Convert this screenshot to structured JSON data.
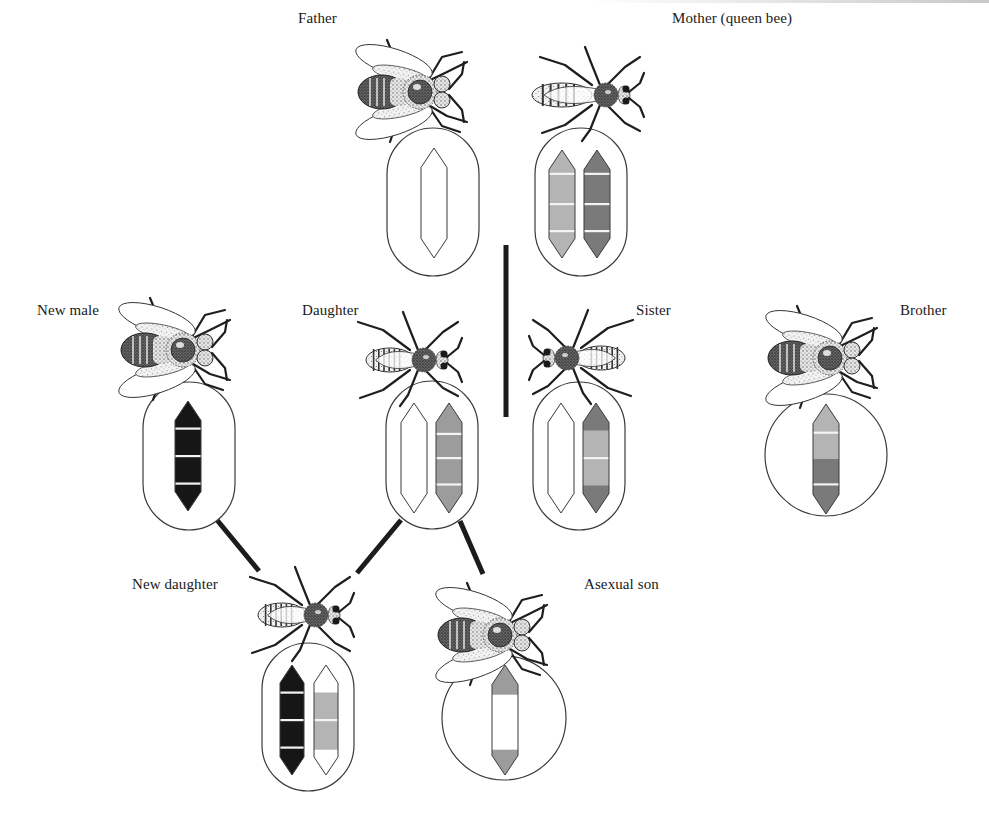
{
  "figure": {
    "colors": {
      "outline": "#3a3a3a",
      "black": "#161616",
      "dark_gray": "#7a7a7a",
      "mid_gray": "#9c9c9c",
      "light_gray": "#b4b4b4",
      "white": "#ffffff",
      "band_line": "#f4f4f4",
      "connector": "#1c1c1c"
    }
  },
  "individuals": [
    {
      "id": "father",
      "label": "Father",
      "label_pos": [
        298,
        10
      ],
      "sex": "male",
      "bee": {
        "cx": 412,
        "cy": 92,
        "dir": "right",
        "kind": "drone"
      },
      "container": {
        "shape": "capsule",
        "x": 387,
        "y": 128,
        "w": 92,
        "h": 148
      },
      "chromosomes": [
        {
          "x": 421,
          "y": 148,
          "w": 26,
          "h": 110,
          "segments": [
            {
              "from": 0,
              "to": 1,
              "color": "white"
            }
          ],
          "lines": []
        }
      ]
    },
    {
      "id": "mother",
      "label": "Mother (queen bee)",
      "label_pos": [
        672,
        10
      ],
      "sex": "female",
      "bee": {
        "cx": 600,
        "cy": 95,
        "dir": "left",
        "kind": "queen"
      },
      "container": {
        "shape": "capsule",
        "x": 535,
        "y": 128,
        "w": 92,
        "h": 148
      },
      "chromosomes": [
        {
          "x": 549,
          "y": 150,
          "w": 26,
          "h": 108,
          "segments": [
            {
              "from": 0,
              "to": 1,
              "color": "light_gray"
            }
          ],
          "lines": [
            0.22,
            0.5,
            0.75
          ]
        },
        {
          "x": 584,
          "y": 150,
          "w": 26,
          "h": 108,
          "segments": [
            {
              "from": 0,
              "to": 1,
              "color": "dark_gray"
            }
          ],
          "lines": [
            0.22,
            0.5,
            0.75
          ]
        }
      ]
    },
    {
      "id": "new-male",
      "label": "New male",
      "label_pos": [
        37,
        302
      ],
      "sex": "male",
      "bee": {
        "cx": 175,
        "cy": 350,
        "dir": "right",
        "kind": "drone"
      },
      "container": {
        "shape": "capsule",
        "x": 143,
        "y": 382,
        "w": 92,
        "h": 148
      },
      "chromosomes": [
        {
          "x": 175,
          "y": 401,
          "w": 26,
          "h": 110,
          "segments": [
            {
              "from": 0,
              "to": 1,
              "color": "black"
            }
          ],
          "lines": [
            0.25,
            0.5,
            0.75
          ]
        }
      ]
    },
    {
      "id": "daughter",
      "label": "Daughter",
      "label_pos": [
        302,
        302
      ],
      "sex": "female",
      "bee": {
        "cx": 418,
        "cy": 360,
        "dir": "left",
        "kind": "worker"
      },
      "container": {
        "shape": "capsule",
        "x": 386,
        "y": 381,
        "w": 92,
        "h": 148
      },
      "chromosomes": [
        {
          "x": 401,
          "y": 403,
          "w": 26,
          "h": 110,
          "segments": [
            {
              "from": 0,
              "to": 1,
              "color": "white"
            }
          ],
          "lines": []
        },
        {
          "x": 436,
          "y": 403,
          "w": 26,
          "h": 110,
          "segments": [
            {
              "from": 0,
              "to": 1,
              "color": "mid_gray"
            }
          ],
          "lines": [
            0.28,
            0.5,
            0.74
          ]
        }
      ]
    },
    {
      "id": "sister",
      "label": "Sister",
      "label_pos": [
        636,
        302
      ],
      "sex": "female",
      "bee": {
        "cx": 573,
        "cy": 358,
        "dir": "right",
        "kind": "worker"
      },
      "container": {
        "shape": "capsule",
        "x": 533,
        "y": 382,
        "w": 92,
        "h": 148
      },
      "chromosomes": [
        {
          "x": 548,
          "y": 403,
          "w": 26,
          "h": 110,
          "segments": [
            {
              "from": 0,
              "to": 1,
              "color": "white"
            }
          ],
          "lines": []
        },
        {
          "x": 583,
          "y": 403,
          "w": 26,
          "h": 110,
          "segments": [
            {
              "from": 0,
              "to": 0.25,
              "color": "dark_gray"
            },
            {
              "from": 0.25,
              "to": 0.75,
              "color": "light_gray"
            },
            {
              "from": 0.75,
              "to": 1,
              "color": "dark_gray"
            }
          ],
          "lines": [
            0.5
          ]
        }
      ]
    },
    {
      "id": "brother",
      "label": "Brother",
      "label_pos": [
        900,
        302
      ],
      "sex": "male",
      "bee": {
        "cx": 822,
        "cy": 358,
        "dir": "right",
        "kind": "drone"
      },
      "container": {
        "shape": "circle",
        "cx": 826,
        "cy": 455,
        "r": 61
      },
      "chromosomes": [
        {
          "x": 813,
          "y": 404,
          "w": 26,
          "h": 110,
          "segments": [
            {
              "from": 0,
              "to": 0.5,
              "color": "light_gray"
            },
            {
              "from": 0.5,
              "to": 1,
              "color": "dark_gray"
            }
          ],
          "lines": [
            0.26,
            0.73
          ]
        }
      ]
    },
    {
      "id": "new-daughter",
      "label": "New daughter",
      "label_pos": [
        132,
        576
      ],
      "sex": "female",
      "bee": {
        "cx": 310,
        "cy": 615,
        "dir": "left",
        "kind": "worker"
      },
      "container": {
        "shape": "capsule",
        "x": 262,
        "y": 643,
        "w": 92,
        "h": 148
      },
      "chromosomes": [
        {
          "x": 280,
          "y": 665,
          "w": 24,
          "h": 110,
          "segments": [
            {
              "from": 0,
              "to": 1,
              "color": "black"
            }
          ],
          "lines": [
            0.25,
            0.5,
            0.75
          ]
        },
        {
          "x": 314,
          "y": 665,
          "w": 24,
          "h": 110,
          "segments": [
            {
              "from": 0,
              "to": 0.25,
              "color": "white"
            },
            {
              "from": 0.25,
              "to": 0.77,
              "color": "light_gray"
            },
            {
              "from": 0.77,
              "to": 1,
              "color": "white"
            }
          ],
          "lines": [
            0.5
          ]
        }
      ]
    },
    {
      "id": "asexual-son",
      "label": "Asexual son",
      "label_pos": [
        584,
        576
      ],
      "sex": "male",
      "bee": {
        "cx": 492,
        "cy": 635,
        "dir": "right",
        "kind": "drone"
      },
      "container": {
        "shape": "circle",
        "cx": 504,
        "cy": 718,
        "r": 62
      },
      "chromosomes": [
        {
          "x": 492,
          "y": 665,
          "w": 26,
          "h": 110,
          "segments": [
            {
              "from": 0,
              "to": 0.27,
              "color": "mid_gray"
            },
            {
              "from": 0.27,
              "to": 0.77,
              "color": "white"
            },
            {
              "from": 0.77,
              "to": 1,
              "color": "mid_gray"
            }
          ],
          "lines": []
        }
      ]
    }
  ],
  "connectors": [
    {
      "id": "new-male-to-new-daughter",
      "x1": 217,
      "y1": 520,
      "x2": 259,
      "y2": 571
    },
    {
      "id": "daughter-to-new-daughter",
      "x1": 401,
      "y1": 520,
      "x2": 357,
      "y2": 573
    },
    {
      "id": "daughter-to-asexual-son",
      "x1": 460,
      "y1": 521,
      "x2": 483,
      "y2": 574
    }
  ],
  "separator": {
    "id": "family-separator",
    "x": 506,
    "y1": 245,
    "y2": 417,
    "width": 5
  }
}
